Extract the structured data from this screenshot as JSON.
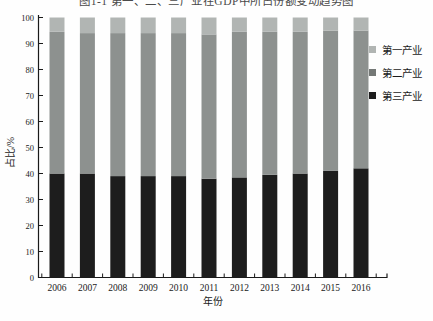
{
  "figure": {
    "title": "图1-1 第一、二、三产业在GDP中所占份额变动趋势图"
  },
  "chart_data": {
    "type": "bar",
    "stacked": true,
    "title": "图1-1 第一、二、三产业在GDP中所占份额变动趋势图",
    "xlabel": "年份",
    "ylabel": "占比/%",
    "categories": [
      "2006",
      "2007",
      "2008",
      "2009",
      "2010",
      "2011",
      "2012",
      "2013",
      "2014",
      "2015",
      "2016"
    ],
    "series": [
      {
        "name": "第三产业",
        "color": "#1d1d1d",
        "values": [
          40,
          40,
          39,
          39,
          39,
          38,
          38.5,
          39.5,
          40,
          41,
          42
        ]
      },
      {
        "name": "第二产业",
        "color": "#8d918f",
        "values": [
          54.5,
          54,
          55,
          55,
          55,
          55.5,
          56,
          55,
          54.5,
          54,
          53
        ]
      },
      {
        "name": "第一产业",
        "color": "#b1b5b3",
        "values": [
          5.5,
          6,
          6,
          6,
          6,
          6.5,
          5.5,
          5.5,
          5.5,
          5,
          5
        ]
      }
    ],
    "legend": [
      {
        "label": "第一产业",
        "color": "#b1b5b3"
      },
      {
        "label": "第二产业",
        "color": "#747876"
      },
      {
        "label": "第三产业",
        "color": "#1d1d1d"
      }
    ],
    "ylim": [
      0,
      100
    ],
    "yticks": [
      0,
      10,
      20,
      30,
      40,
      50,
      60,
      70,
      80,
      90,
      100
    ],
    "grid": false,
    "legend_position": "top-right",
    "axis_color": "#1a1a1a"
  }
}
